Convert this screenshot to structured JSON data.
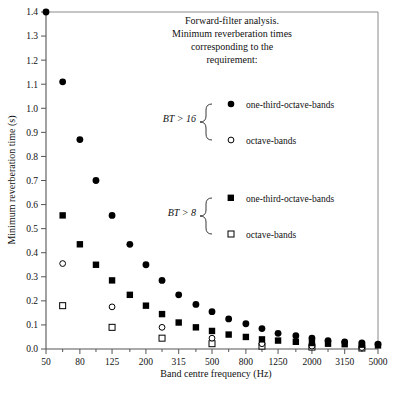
{
  "chart_data": {
    "type": "scatter",
    "title": "",
    "annotation_lines": [
      "Forward-filter analysis.",
      "Minimum reverberation times",
      "corresponding to the",
      "requirement:"
    ],
    "xlabel": "Band centre frequency (Hz)",
    "ylabel": "Minimum reverberation time (s)",
    "xscale": "log",
    "xlim": [
      50,
      5000
    ],
    "ylim": [
      0.0,
      1.4
    ],
    "grid": false,
    "legend_position": "inside-upper-right",
    "xtick_labels": [
      "50",
      "80",
      "125",
      "200",
      "315",
      "500",
      "800",
      "1250",
      "2000",
      "3150",
      "5000"
    ],
    "xtick_values": [
      50,
      80,
      125,
      200,
      315,
      500,
      800,
      1250,
      2000,
      3150,
      5000
    ],
    "xminor_values": [
      63,
      100,
      160,
      250,
      400,
      630,
      1000,
      1600,
      2500,
      4000
    ],
    "ytick_labels": [
      "0.0",
      "0.1",
      "0.2",
      "0.3",
      "0.4",
      "0.5",
      "0.6",
      "0.7",
      "0.8",
      "0.9",
      "1.0",
      "1.1",
      "1.2",
      "1.3",
      "1.4"
    ],
    "ytick_values": [
      0.0,
      0.1,
      0.2,
      0.3,
      0.4,
      0.5,
      0.6,
      0.7,
      0.8,
      0.9,
      1.0,
      1.1,
      1.2,
      1.3,
      1.4
    ],
    "series": [
      {
        "name": "one-third-octave-bands",
        "condition": "BT > 16",
        "marker": "filled-circle",
        "color": "#000000",
        "x": [
          50,
          63,
          80,
          100,
          125,
          160,
          200,
          250,
          315,
          400,
          500,
          630,
          800,
          1000,
          1250,
          1600,
          2000,
          2500,
          3150,
          4000,
          5000
        ],
        "y": [
          1.4,
          1.11,
          0.87,
          0.7,
          0.555,
          0.435,
          0.35,
          0.285,
          0.225,
          0.185,
          0.155,
          0.125,
          0.105,
          0.085,
          0.065,
          0.055,
          0.045,
          0.035,
          0.03,
          0.025,
          0.02
        ]
      },
      {
        "name": "octave-bands",
        "condition": "BT > 16",
        "marker": "open-circle",
        "color": "#000000",
        "x": [
          63,
          125,
          250,
          500,
          1000,
          2000,
          4000
        ],
        "y": [
          0.355,
          0.175,
          0.09,
          0.045,
          0.022,
          0.012,
          0.006
        ]
      },
      {
        "name": "one-third-octave-bands",
        "condition": "BT > 8",
        "marker": "filled-square",
        "color": "#000000",
        "x": [
          63,
          80,
          100,
          125,
          160,
          200,
          250,
          315,
          400,
          500,
          630,
          800,
          1000,
          1250,
          1600,
          2000,
          2500,
          3150,
          4000,
          5000
        ],
        "y": [
          0.555,
          0.435,
          0.35,
          0.285,
          0.225,
          0.18,
          0.145,
          0.11,
          0.09,
          0.075,
          0.06,
          0.05,
          0.04,
          0.035,
          0.03,
          0.025,
          0.022,
          0.02,
          0.018,
          0.015
        ]
      },
      {
        "name": "octave-bands",
        "condition": "BT > 8",
        "marker": "open-square",
        "color": "#000000",
        "x": [
          63,
          125,
          250,
          500,
          1000,
          2000,
          4000
        ],
        "y": [
          0.18,
          0.09,
          0.045,
          0.022,
          0.012,
          0.008,
          0.004
        ]
      }
    ],
    "legend_groups": [
      {
        "condition": "BT > 16",
        "entries": [
          {
            "marker": "filled-circle",
            "label": "one-third-octave-bands"
          },
          {
            "marker": "open-circle",
            "label": "octave-bands"
          }
        ]
      },
      {
        "condition": "BT > 8",
        "entries": [
          {
            "marker": "filled-square",
            "label": "one-third-octave-bands"
          },
          {
            "marker": "open-square",
            "label": "octave-bands"
          }
        ]
      }
    ]
  }
}
